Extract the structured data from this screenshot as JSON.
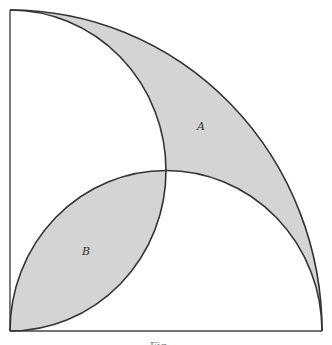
{
  "figure": {
    "colors": {
      "shade": "#d4d4d4",
      "stroke": "#333333",
      "background": "#ffffff"
    },
    "labels": {
      "A": "A",
      "B": "B"
    },
    "caption": "Fig"
  }
}
